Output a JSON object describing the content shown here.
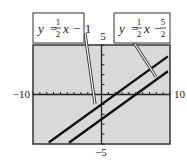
{
  "chart_data": {
    "type": "line",
    "title": "",
    "xlabel": "",
    "ylabel": "",
    "xlim": [
      -10,
      10
    ],
    "ylim": [
      -5,
      5
    ],
    "grid": false,
    "x_tick_spacing": 1,
    "y_tick_spacing": 1,
    "axis_labels": {
      "xmin": "−10",
      "xmax": "10",
      "ymin": "−5",
      "ymax": "5"
    },
    "background": "#d9d9d9",
    "series": [
      {
        "name": "y = 1/2 x − 1",
        "slope": 0.5,
        "intercept": -1,
        "x": [
          -7.7,
          9.7
        ],
        "y": [
          -4.85,
          3.85
        ],
        "color": "#111111"
      },
      {
        "name": "y = 1/2 x − 5/2",
        "slope": 0.5,
        "intercept": -2.5,
        "x": [
          -4.75,
          9.7
        ],
        "y": [
          -4.875,
          2.35
        ],
        "color": "#111111"
      }
    ],
    "annotations": [
      {
        "label": "y = ½x − 1",
        "parts": {
          "lhs": "y",
          "eq": "=",
          "num": "1",
          "den": "2",
          "var": "x",
          "op": "−",
          "const": "1"
        },
        "target_series": 0
      },
      {
        "label": "y = ½x − 5/2",
        "parts": {
          "lhs": "y",
          "eq": "=",
          "num": "1",
          "den": "2",
          "var": "x",
          "op": "−",
          "const_num": "5",
          "const_den": "2"
        },
        "target_series": 1
      }
    ]
  }
}
